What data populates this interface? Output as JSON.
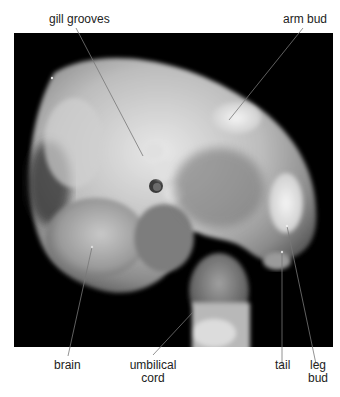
{
  "figure": {
    "background_color": "#000000",
    "label_color": "#222222",
    "leader_line_color": "#777777",
    "labels": [
      {
        "id": "gill-grooves",
        "text": "gill grooves"
      },
      {
        "id": "arm-bud",
        "text": "arm bud"
      },
      {
        "id": "brain",
        "text": "brain"
      },
      {
        "id": "umbilical-cord",
        "line1": "umbilical",
        "line2": "cord"
      },
      {
        "id": "tail",
        "text": "tail"
      },
      {
        "id": "leg-bud",
        "line1": "leg",
        "line2": "bud"
      }
    ]
  }
}
